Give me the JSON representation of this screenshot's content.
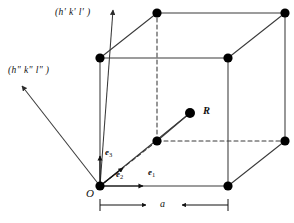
{
  "figure": {
    "type": "crystal-unit-cell-diagram"
  },
  "labels": {
    "ray_upper": "(h' k' l' )",
    "ray_lower": "(h\" k\" l\" )",
    "origin": "O",
    "point_r": "R",
    "lattice_constant": "a",
    "basis_e1_sym": "e",
    "basis_e1_sub": "1",
    "basis_e2_sym": "e",
    "basis_e2_sub": "2",
    "basis_e3_sym": "e",
    "basis_e3_sub": "3"
  },
  "geometry": {
    "origin": [
      100,
      186
    ],
    "cube_side_px": 128,
    "depth_offset": [
      57,
      -45
    ],
    "front_face": [
      [
        100,
        186
      ],
      [
        228,
        186
      ],
      [
        228,
        58
      ],
      [
        100,
        58
      ]
    ],
    "back_face": [
      [
        157,
        141
      ],
      [
        285,
        141
      ],
      [
        285,
        13
      ],
      [
        157,
        13
      ]
    ],
    "point_r": [
      190,
      113
    ],
    "bottom_face_center": [
      157,
      157
    ],
    "vertices": [
      [
        100,
        186
      ],
      [
        228,
        186
      ],
      [
        228,
        58
      ],
      [
        100,
        58
      ],
      [
        157,
        141
      ],
      [
        285,
        141
      ],
      [
        285,
        13
      ],
      [
        157,
        13
      ]
    ],
    "dashed_edges": [
      [
        [
          157,
          141
        ],
        [
          285,
          141
        ]
      ],
      [
        [
          157,
          141
        ],
        [
          157,
          13
        ]
      ],
      [
        [
          157,
          141
        ],
        [
          100,
          186
        ]
      ]
    ],
    "ray_upper_end": [
      113,
      10
    ],
    "ray_lower_end": [
      22,
      86
    ],
    "dimension_line_y": 205,
    "dimension_from_x": 100,
    "dimension_to_x": 228
  },
  "style": {
    "stroke": "#3a3a3a",
    "vertex_fill": "#000000",
    "vertex_radius": 4.6,
    "line_width": 1.05,
    "dash_pattern": "4,3"
  }
}
